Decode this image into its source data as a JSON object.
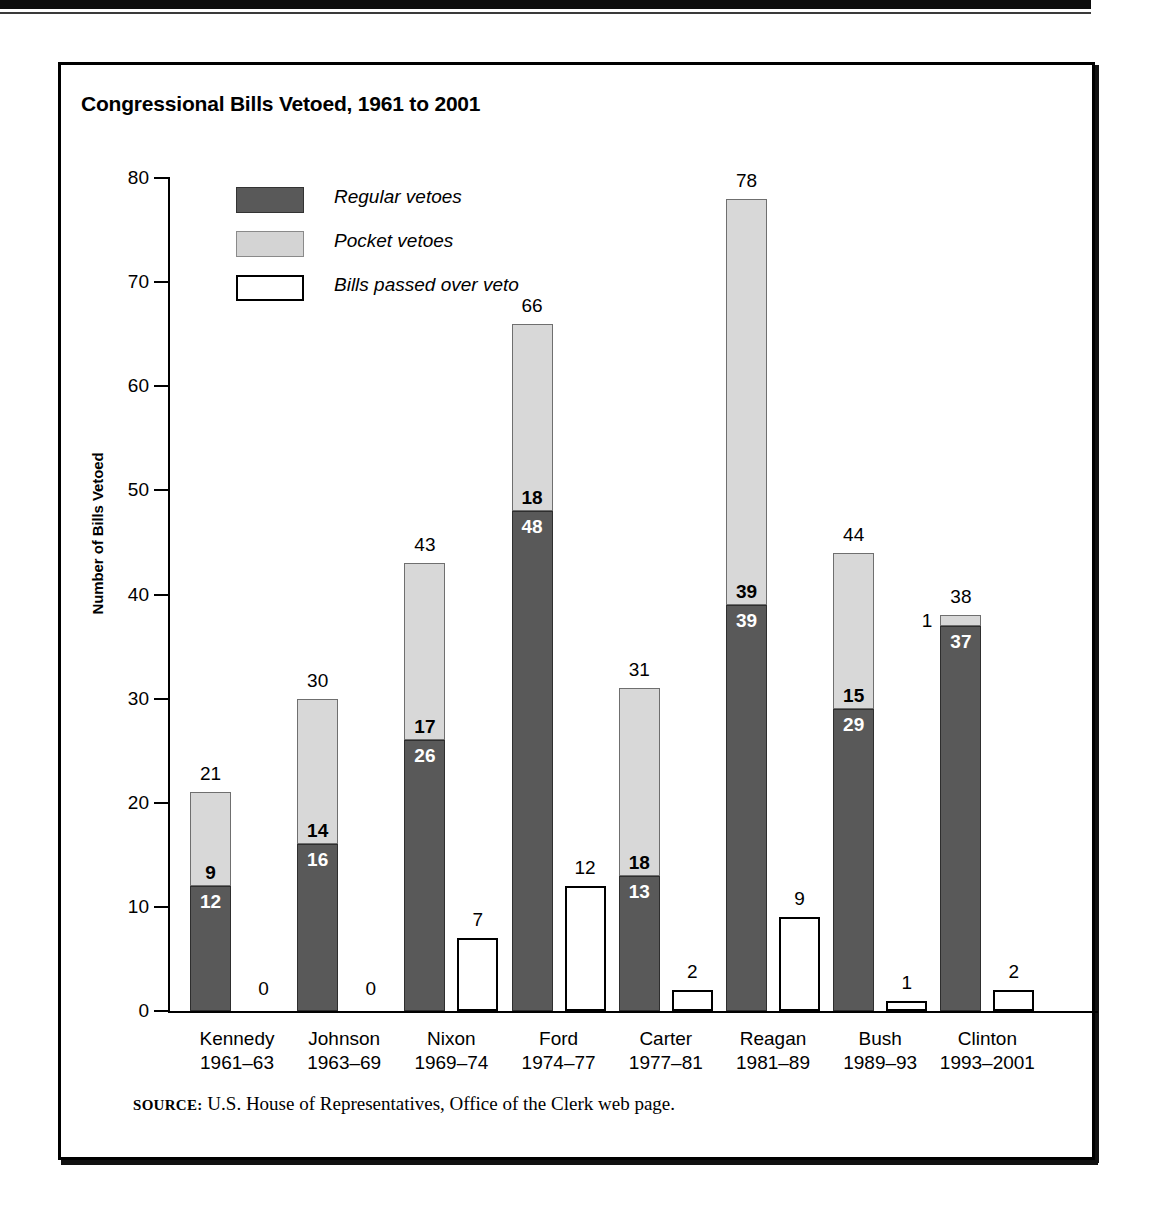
{
  "chart_data": {
    "type": "bar",
    "title": "Congressional Bills Vetoed, 1961 to 2001",
    "xlabel": "",
    "ylabel": "Number of Bills Vetoed",
    "ylim": [
      0,
      80
    ],
    "yticks": [
      0,
      10,
      20,
      30,
      40,
      50,
      60,
      70,
      80
    ],
    "grid": false,
    "legend_position": "upper-left-inside",
    "stacked": true,
    "categories": [
      "Kennedy",
      "Johnson",
      "Nixon",
      "Ford",
      "Carter",
      "Reagan",
      "Bush",
      "Clinton"
    ],
    "category_years": [
      "1961–63",
      "1963–69",
      "1969–74",
      "1974–77",
      "1977–81",
      "1981–89",
      "1989–93",
      "1993–2001"
    ],
    "series": [
      {
        "name": "Regular vetoes",
        "color": "#595959",
        "values": [
          12,
          16,
          26,
          48,
          13,
          39,
          29,
          37
        ]
      },
      {
        "name": "Pocket vetoes",
        "color": "#d8d8d8",
        "values": [
          9,
          14,
          17,
          18,
          18,
          39,
          15,
          1
        ]
      },
      {
        "name": "Bills passed over veto",
        "color": "#ffffff",
        "values": [
          0,
          0,
          7,
          12,
          2,
          9,
          1,
          2
        ]
      }
    ],
    "stack_totals": [
      21,
      30,
      43,
      66,
      31,
      78,
      44,
      38
    ],
    "annotations": {
      "note": "Stacked bar shows regular + pocket vetoes with total above; a separate adjacent white bar shows bills passed over veto."
    }
  },
  "legend": {
    "items": [
      {
        "label": "Regular vetoes",
        "swatch": "dark-gray-swatch"
      },
      {
        "label": "Pocket vetoes",
        "swatch": "light-gray-swatch"
      },
      {
        "label": "Bills passed over veto",
        "swatch": "white-swatch"
      }
    ]
  },
  "axes": {
    "y_title": "Number of Bills Vetoed",
    "y_ticks": [
      "80",
      "70",
      "60",
      "50",
      "40",
      "30",
      "20",
      "10",
      "0"
    ]
  },
  "source": {
    "word": "SOURCE:",
    "text": " U.S. House of Representatives, Office of the Clerk web page."
  }
}
